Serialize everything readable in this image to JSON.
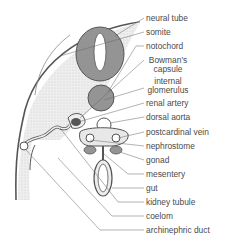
{
  "figure": {
    "labels": [
      {
        "id": "neural-tube",
        "text": "neural tube"
      },
      {
        "id": "somite",
        "text": "somite"
      },
      {
        "id": "notochord",
        "text": "notochord"
      },
      {
        "id": "bowmans-capsule",
        "line1": "Bowman's",
        "line2": "capsule"
      },
      {
        "id": "internal-glomerulus",
        "line1": "internal",
        "line2": "glomerulus"
      },
      {
        "id": "renal-artery",
        "text": "renal artery"
      },
      {
        "id": "dorsal-aorta",
        "text": "dorsal aorta"
      },
      {
        "id": "postcardinal-vein",
        "text": "postcardinal vein"
      },
      {
        "id": "nephrostome",
        "text": "nephrostome"
      },
      {
        "id": "gonad",
        "text": "gonad"
      },
      {
        "id": "mesentery",
        "text": "mesentery"
      },
      {
        "id": "gut",
        "text": "gut"
      },
      {
        "id": "kidney-tubule",
        "text": "kidney tubule"
      },
      {
        "id": "coelom",
        "text": "coelom"
      },
      {
        "id": "archinephric-duct",
        "text": "archinephric duct"
      }
    ]
  },
  "colors": {
    "line": "#555555",
    "tissue_fill": "#e9e9e9",
    "dark_fill": "#8d8d8d",
    "text": "#4a4a4a"
  }
}
